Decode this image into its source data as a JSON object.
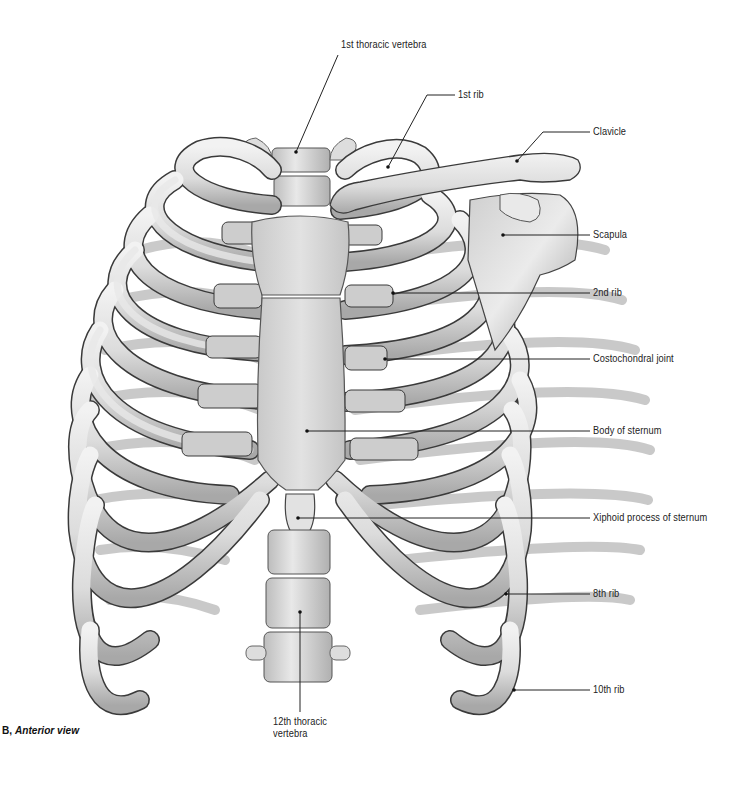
{
  "figure": {
    "caption_prefix": "B,",
    "caption_title": "Anterior view"
  },
  "labels": [
    {
      "id": "first-thoracic-vertebra",
      "text": "1st thoracic vertebra"
    },
    {
      "id": "first-rib",
      "text": "1st rib"
    },
    {
      "id": "clavicle",
      "text": "Clavicle"
    },
    {
      "id": "scapula",
      "text": "Scapula"
    },
    {
      "id": "second-rib",
      "text": "2nd rib"
    },
    {
      "id": "costochondral-joint",
      "text": "Costochondral joint"
    },
    {
      "id": "body-of-sternum",
      "text": "Body of sternum"
    },
    {
      "id": "xiphoid-process",
      "text": "Xiphoid process of sternum"
    },
    {
      "id": "eighth-rib",
      "text": "8th rib"
    },
    {
      "id": "tenth-rib",
      "text": "10th rib"
    },
    {
      "id": "twelfth-thoracic-vertebra",
      "text": "12th thoracic vertebra"
    }
  ],
  "colors": {
    "background": "#ffffff",
    "bone": "#e4e4e4",
    "bone_shadow": "#9a9a9a",
    "cartilage": "#cfcfcf",
    "outline": "#3a3a3a",
    "leader": "#222222"
  }
}
